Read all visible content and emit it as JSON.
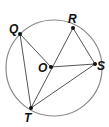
{
  "diagram": {
    "circle": {
      "cx": 54,
      "cy": 68,
      "r": 48,
      "color": "#8a8a8a"
    },
    "points": {
      "Q": {
        "label": "Q",
        "x": 20,
        "y": 34
      },
      "R": {
        "label": "R",
        "x": 73,
        "y": 28
      },
      "O": {
        "label": "O",
        "x": 51,
        "y": 67
      },
      "S": {
        "label": "S",
        "x": 95,
        "y": 64
      },
      "T": {
        "label": "T",
        "x": 31,
        "y": 108
      }
    },
    "segments": [
      "QO",
      "QT",
      "RO",
      "OT",
      "OS",
      "RS",
      "TS"
    ]
  }
}
